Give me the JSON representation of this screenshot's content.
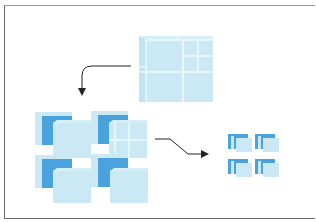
{
  "diagram": {
    "type": "cube-decomposition",
    "stages": [
      {
        "id": "stage-1",
        "label": "",
        "description": "large cube subdivided into octants, one octant further subdivided"
      },
      {
        "id": "stage-2",
        "label": "",
        "description": "eight separated medium sub-cubes arranged in 2x2 pairs"
      },
      {
        "id": "stage-3",
        "label": "",
        "description": "four small clusters of stacked thin slices"
      }
    ],
    "arrows": [
      {
        "from": "stage-1",
        "to": "stage-2",
        "style": "curved-down"
      },
      {
        "from": "stage-2",
        "to": "stage-3",
        "style": "s-curve-right"
      }
    ],
    "colors": {
      "cube_face_light": "#cbe9f5",
      "cube_face_mid": "#b3dff1",
      "cube_face_dark": "#4aa3dc",
      "grid_line": "#ffffff",
      "arrow": "#222222",
      "frame": "#6a6a6a",
      "background": "#ffffff"
    }
  }
}
